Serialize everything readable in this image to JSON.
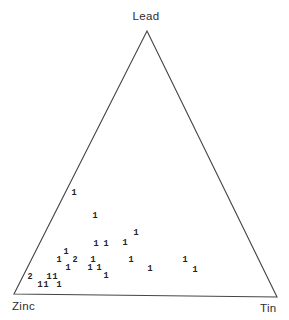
{
  "figure": {
    "background": "#ffffff",
    "line_color": "#454545",
    "label_color": "#2e2e2e",
    "point_color": "#222222"
  },
  "chart_data": {
    "type": "scatter",
    "subtype": "ternary-diagram",
    "title": "",
    "axes": {
      "top_vertex": "Lead",
      "bottom_left_vertex": "Zinc",
      "bottom_right_vertex": "Tin"
    },
    "grid": false,
    "legend": "none",
    "marker_style": "numeral counts plotted at composition positions",
    "triangle_px": {
      "top": [
        147,
        31
      ],
      "bottom_left": [
        14,
        294
      ],
      "bottom_right": [
        277,
        297
      ]
    },
    "points": [
      {
        "count": 1,
        "px": 74,
        "py": 193,
        "lead_pct": 39,
        "zinc_pct": 58,
        "tin_pct": 3
      },
      {
        "count": 1,
        "px": 95,
        "py": 216,
        "lead_pct": 30,
        "zinc_pct": 54,
        "tin_pct": 16
      },
      {
        "count": 1,
        "px": 136,
        "py": 233,
        "lead_pct": 23,
        "zinc_pct": 42,
        "tin_pct": 35
      },
      {
        "count": 1,
        "px": 96,
        "py": 244,
        "lead_pct": 19,
        "zinc_pct": 59,
        "tin_pct": 22
      },
      {
        "count": 1,
        "px": 106,
        "py": 244,
        "lead_pct": 19,
        "zinc_pct": 55,
        "tin_pct": 26
      },
      {
        "count": 1,
        "px": 125,
        "py": 243,
        "lead_pct": 19,
        "zinc_pct": 48,
        "tin_pct": 33
      },
      {
        "count": 1,
        "px": 66,
        "py": 252,
        "lead_pct": 16,
        "zinc_pct": 72,
        "tin_pct": 12
      },
      {
        "count": 1,
        "px": 59,
        "py": 260,
        "lead_pct": 13,
        "zinc_pct": 76,
        "tin_pct": 11
      },
      {
        "count": 2,
        "px": 75,
        "py": 260,
        "lead_pct": 13,
        "zinc_pct": 70,
        "tin_pct": 17
      },
      {
        "count": 1,
        "px": 93,
        "py": 260,
        "lead_pct": 13,
        "zinc_pct": 63,
        "tin_pct": 24
      },
      {
        "count": 1,
        "px": 131,
        "py": 260,
        "lead_pct": 13,
        "zinc_pct": 49,
        "tin_pct": 38
      },
      {
        "count": 1,
        "px": 185,
        "py": 260,
        "lead_pct": 13,
        "zinc_pct": 28,
        "tin_pct": 59
      },
      {
        "count": 1,
        "px": 68,
        "py": 268,
        "lead_pct": 10,
        "zinc_pct": 74,
        "tin_pct": 16
      },
      {
        "count": 1,
        "px": 90,
        "py": 268,
        "lead_pct": 10,
        "zinc_pct": 66,
        "tin_pct": 24
      },
      {
        "count": 1,
        "px": 99,
        "py": 268,
        "lead_pct": 10,
        "zinc_pct": 62,
        "tin_pct": 28
      },
      {
        "count": 1,
        "px": 150,
        "py": 269,
        "lead_pct": 10,
        "zinc_pct": 43,
        "tin_pct": 47
      },
      {
        "count": 1,
        "px": 195,
        "py": 270,
        "lead_pct": 9,
        "zinc_pct": 26,
        "tin_pct": 65
      },
      {
        "count": 1,
        "px": 106,
        "py": 276,
        "lead_pct": 7,
        "zinc_pct": 61,
        "tin_pct": 32
      },
      {
        "count": 2,
        "px": 30,
        "py": 277,
        "lead_pct": 7,
        "zinc_pct": 90,
        "tin_pct": 3
      },
      {
        "count": 1,
        "px": 49,
        "py": 277,
        "lead_pct": 7,
        "zinc_pct": 83,
        "tin_pct": 10
      },
      {
        "count": 1,
        "px": 55,
        "py": 277,
        "lead_pct": 7,
        "zinc_pct": 81,
        "tin_pct": 12
      },
      {
        "count": 1,
        "px": 40,
        "py": 285,
        "lead_pct": 4,
        "zinc_pct": 88,
        "tin_pct": 8
      },
      {
        "count": 1,
        "px": 46,
        "py": 285,
        "lead_pct": 4,
        "zinc_pct": 86,
        "tin_pct": 10
      },
      {
        "count": 1,
        "px": 59,
        "py": 285,
        "lead_pct": 4,
        "zinc_pct": 81,
        "tin_pct": 15
      }
    ]
  }
}
